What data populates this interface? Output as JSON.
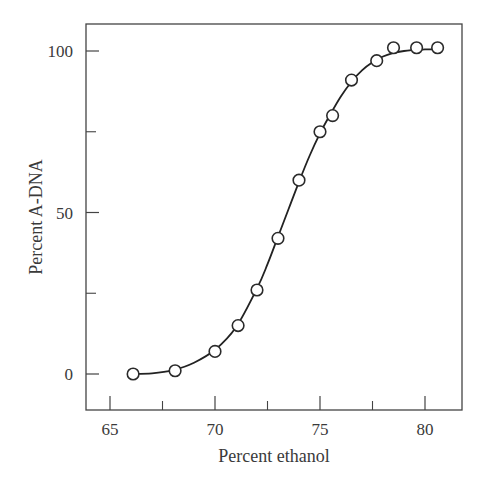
{
  "chart_data": {
    "type": "line",
    "title": "",
    "xlabel": "Percent ethanol",
    "ylabel": "Percent A-DNA",
    "xlim": [
      63.8,
      81.8
    ],
    "ylim": [
      -11,
      112
    ],
    "x_ticks": [
      65,
      70,
      75,
      80
    ],
    "x_minor_ticks": [
      67.5,
      72.5,
      77.5
    ],
    "y_ticks": [
      0,
      50,
      100
    ],
    "y_minor_ticks": [
      25,
      75
    ],
    "grid": false,
    "legend": null,
    "series": [
      {
        "name": "Percent A-DNA",
        "marker": "open-circle",
        "line": "smooth sigmoid fit",
        "x": [
          66.1,
          68.1,
          70.0,
          71.1,
          72.0,
          73.0,
          74.0,
          75.0,
          75.6,
          76.5,
          77.7,
          78.5,
          79.6,
          80.6
        ],
        "y": [
          0,
          1,
          7,
          15,
          26,
          42,
          60,
          75,
          80,
          91,
          97,
          101,
          101,
          101
        ]
      }
    ],
    "fit_curve": {
      "x": [
        66.0,
        67.0,
        68.0,
        69.0,
        70.0,
        71.0,
        72.0,
        72.5,
        73.0,
        73.5,
        74.0,
        74.5,
        75.0,
        75.5,
        76.0,
        76.5,
        77.0,
        77.5,
        78.0,
        78.5,
        79.0,
        79.5,
        80.0,
        80.6
      ],
      "y": [
        0,
        0.2,
        1.2,
        3.5,
        7.5,
        14.5,
        26.5,
        34,
        42.5,
        51,
        59.5,
        67.5,
        74.5,
        80.5,
        86,
        90.5,
        94,
        96.5,
        98.3,
        99.4,
        100,
        100.3,
        100.5,
        100.5
      ]
    },
    "colors": {
      "line": "#222222",
      "marker_fill": "#ffffff",
      "marker_edge": "#2a2a2a",
      "axis": "#444444",
      "text": "#3a3a3a"
    }
  }
}
